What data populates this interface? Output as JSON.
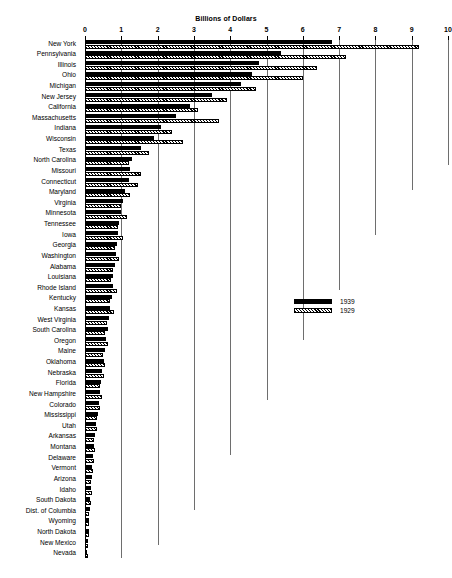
{
  "chart_data": {
    "type": "bar",
    "orientation": "horizontal",
    "title": "Billions of Dollars",
    "xlabel": "Billions of Dollars",
    "ylabel": "",
    "xlim": [
      0,
      10
    ],
    "xticks": [
      "0",
      "1",
      "2",
      "3",
      "4",
      "5",
      "6",
      "7",
      "8",
      "9",
      "10"
    ],
    "grid": true,
    "legend_position": "middle-right",
    "categories": [
      "New York",
      "Pennsylvania",
      "Illinois",
      "Ohio",
      "Michigan",
      "New Jersey",
      "California",
      "Massachusetts",
      "Indiana",
      "Wisconsin",
      "Texas",
      "North Carolina",
      "Missouri",
      "Connecticut",
      "Maryland",
      "Virginia",
      "Minnesota",
      "Tennessee",
      "Iowa",
      "Georgia",
      "Washington",
      "Alabama",
      "Louisiana",
      "Rhode Island",
      "Kentucky",
      "Kansas",
      "West Virginia",
      "South Carolina",
      "Oregon",
      "Maine",
      "Oklahoma",
      "Nebraska",
      "Florida",
      "New Hampshire",
      "Colorado",
      "Mississippi",
      "Utah",
      "Arkansas",
      "Montana",
      "Delaware",
      "Vermont",
      "Arizona",
      "Idaho",
      "South Dakota",
      "Dist. of Columbia",
      "Wyoming",
      "North Dakota",
      "New Mexico",
      "Nevada"
    ],
    "series": [
      {
        "name": "1939",
        "color": "#000000",
        "pattern": "solid",
        "values": [
          6.8,
          5.4,
          4.8,
          4.6,
          4.3,
          3.5,
          2.9,
          2.5,
          2.1,
          1.9,
          1.55,
          1.3,
          1.25,
          1.2,
          1.1,
          1.05,
          1.0,
          0.95,
          0.92,
          0.88,
          0.85,
          0.82,
          0.78,
          0.76,
          0.74,
          0.7,
          0.66,
          0.62,
          0.58,
          0.54,
          0.52,
          0.48,
          0.45,
          0.42,
          0.38,
          0.35,
          0.3,
          0.28,
          0.25,
          0.22,
          0.2,
          0.18,
          0.16,
          0.14,
          0.13,
          0.11,
          0.1,
          0.08,
          0.06
        ]
      },
      {
        "name": "1929",
        "color": "#000000",
        "pattern": "hatched",
        "values": [
          9.2,
          7.2,
          6.4,
          6.0,
          4.7,
          3.9,
          3.1,
          3.7,
          2.4,
          2.7,
          1.75,
          1.2,
          1.55,
          1.45,
          1.25,
          1.0,
          1.15,
          0.9,
          1.05,
          0.82,
          0.95,
          0.76,
          0.72,
          0.88,
          0.68,
          0.8,
          0.6,
          0.56,
          0.62,
          0.5,
          0.56,
          0.52,
          0.4,
          0.46,
          0.42,
          0.32,
          0.33,
          0.26,
          0.28,
          0.25,
          0.22,
          0.16,
          0.18,
          0.16,
          0.12,
          0.12,
          0.11,
          0.09,
          0.07
        ]
      }
    ]
  },
  "legend": {
    "entries": [
      {
        "label": "1939",
        "pattern": "solid"
      },
      {
        "label": "1929",
        "pattern": "hatched"
      }
    ]
  },
  "footer": {
    "note": ""
  }
}
